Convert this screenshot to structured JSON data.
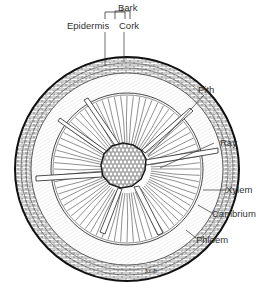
{
  "diagram": {
    "labels": {
      "bark": "Bark",
      "epidermis": "Epidermis",
      "cork": "Cork",
      "pith": "Pith",
      "ray": "Ray",
      "xylem": "Xylem",
      "cambrium": "Cambrium",
      "phloem": "Phloem"
    },
    "signature": "KCB",
    "colors": {
      "ink": "#1a1a1a",
      "label_text": "#333333",
      "hatch": "#999999",
      "background": "#ffffff"
    }
  }
}
